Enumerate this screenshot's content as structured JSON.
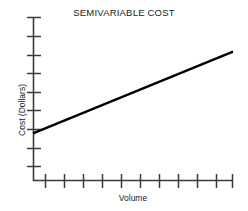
{
  "chart_data": {
    "type": "line",
    "title": "SEMIVARIABLE COST",
    "xlabel": "Volume",
    "ylabel": "Cost (Dollars)",
    "grid": false,
    "legend": false,
    "xlim": [
      0,
      10
    ],
    "ylim": [
      0,
      9
    ],
    "x_tick_count": 11,
    "y_tick_count": 9,
    "x_tick_labels": [],
    "y_tick_labels": [],
    "series": [
      {
        "name": "Semivariable cost",
        "x": [
          0,
          10
        ],
        "values": [
          2.6,
          7.1
        ],
        "intercept": 2.6,
        "slope": 0.45,
        "color": "#000000"
      }
    ],
    "annotations": []
  },
  "axes": {
    "axis_color": "#3a3a3a",
    "line_color": "#000000"
  }
}
